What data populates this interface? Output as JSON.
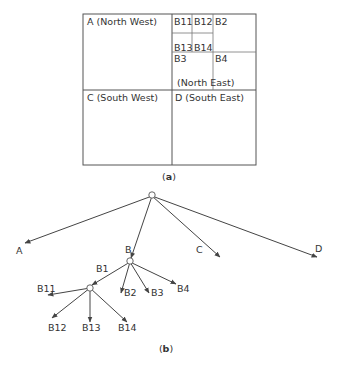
{
  "figure_a": {
    "caption_open": "(",
    "caption_letter": "a",
    "caption_close": ")",
    "quadrants": {
      "nw": "A (North West)",
      "ne": "(North East)",
      "sw": "C (South West)",
      "se": "D (South East)"
    },
    "ne_cells": {
      "b11": "B11",
      "b12": "B12",
      "b13": "B13",
      "b14": "B14",
      "b2": "B2",
      "b3": "B3",
      "b4": "B4"
    }
  },
  "figure_b": {
    "caption_open": "(",
    "caption_letter": "b",
    "caption_close": ")",
    "root_children": {
      "a": "A",
      "b": "B",
      "c": "C",
      "d": "D"
    },
    "b_children": {
      "b1": "B1",
      "b2": "B2",
      "b3": "B3",
      "b4": "B4"
    },
    "b1_children": {
      "b11": "B11",
      "b12": "B12",
      "b13": "B13",
      "b14": "B14"
    }
  }
}
